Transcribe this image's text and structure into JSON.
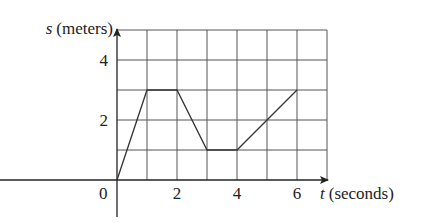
{
  "chart_data": {
    "type": "line",
    "title": "",
    "xlabel_var": "t",
    "xlabel_unit": "(seconds)",
    "ylabel_var": "s",
    "ylabel_unit": "(meters)",
    "x": [
      0,
      1,
      2,
      3,
      4,
      6
    ],
    "y": [
      0,
      3,
      3,
      1,
      1,
      3
    ],
    "xlim": [
      0,
      7
    ],
    "ylim": [
      0,
      5
    ],
    "xticks": [
      0,
      2,
      4,
      6
    ],
    "yticks": [
      2,
      4
    ],
    "grid": true,
    "grid_step": 1,
    "legend": null
  },
  "labels": {
    "x_axis": "t (seconds)",
    "y_axis": "s (meters)",
    "origin": "0",
    "xtick_labels": [
      "2",
      "4",
      "6"
    ],
    "ytick_labels": [
      "2",
      "4"
    ]
  },
  "colors": {
    "grid": "#555555",
    "axis": "#222222",
    "line": "#333333"
  }
}
